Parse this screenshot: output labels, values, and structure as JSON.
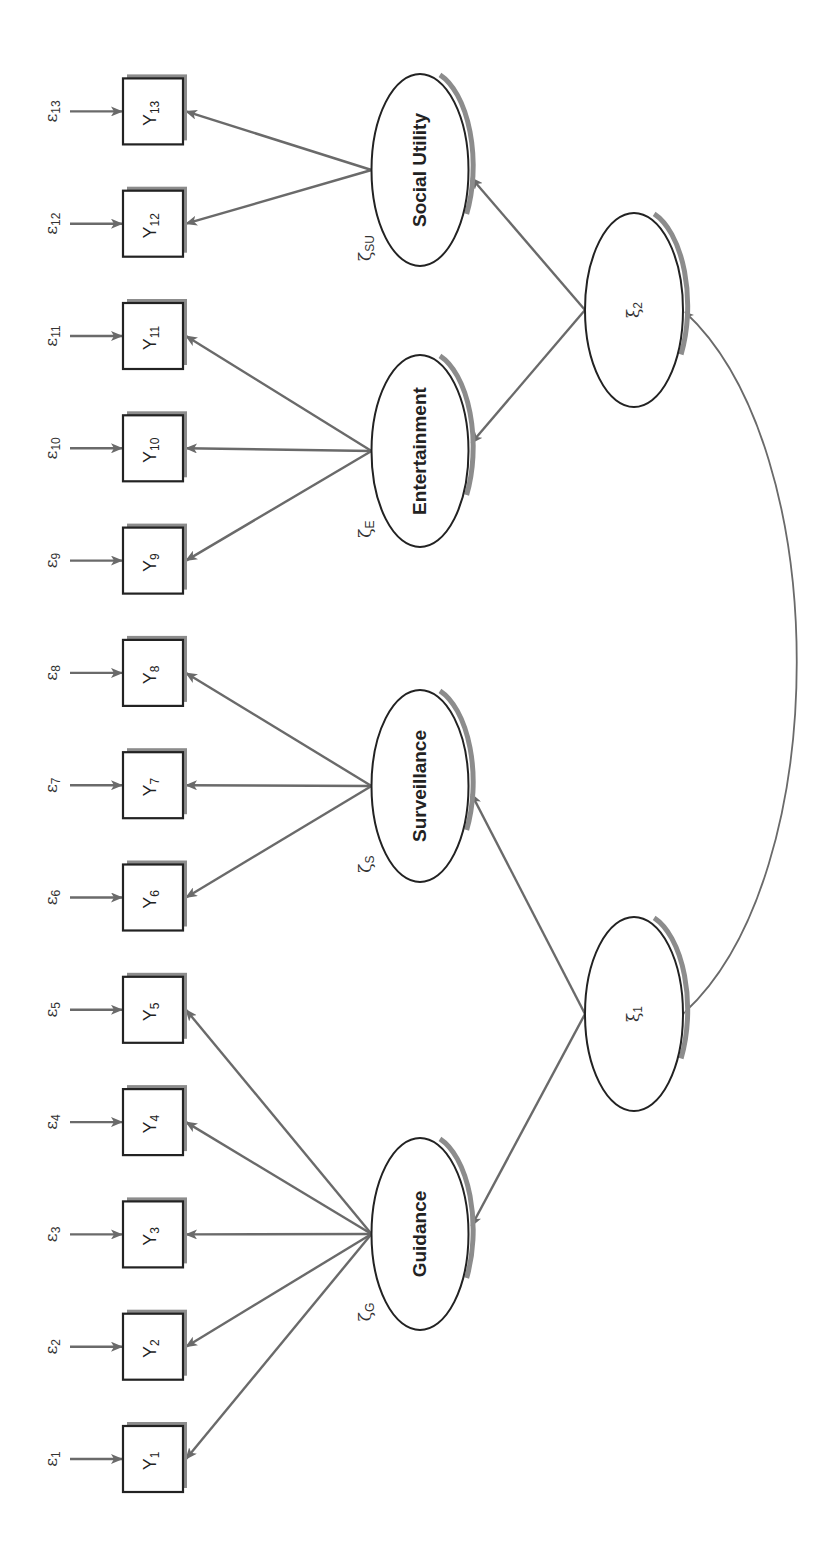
{
  "diagram": {
    "type": "structural-equation-model",
    "orientation": "rotated-90-ccw",
    "colors": {
      "path": "#6a6a6a",
      "shadow": "#8c8c8c",
      "outline": "#222222"
    },
    "observed": [
      {
        "id": "Y1",
        "base": "Y",
        "sub": "1",
        "error_base": "ε",
        "error_sub": "1",
        "factor": "guidance"
      },
      {
        "id": "Y2",
        "base": "Y",
        "sub": "2",
        "error_base": "ε",
        "error_sub": "2",
        "factor": "guidance"
      },
      {
        "id": "Y3",
        "base": "Y",
        "sub": "3",
        "error_base": "ε",
        "error_sub": "3",
        "factor": "guidance"
      },
      {
        "id": "Y4",
        "base": "Y",
        "sub": "4",
        "error_base": "ε",
        "error_sub": "4",
        "factor": "guidance"
      },
      {
        "id": "Y5",
        "base": "Y",
        "sub": "5",
        "error_base": "ε",
        "error_sub": "5",
        "factor": "guidance"
      },
      {
        "id": "Y6",
        "base": "Y",
        "sub": "6",
        "error_base": "ε",
        "error_sub": "6",
        "factor": "surveillance"
      },
      {
        "id": "Y7",
        "base": "Y",
        "sub": "7",
        "error_base": "ε",
        "error_sub": "7",
        "factor": "surveillance"
      },
      {
        "id": "Y8",
        "base": "Y",
        "sub": "8",
        "error_base": "ε",
        "error_sub": "8",
        "factor": "surveillance"
      },
      {
        "id": "Y9",
        "base": "Y",
        "sub": "9",
        "error_base": "ε",
        "error_sub": "9",
        "factor": "entertainment"
      },
      {
        "id": "Y10",
        "base": "Y",
        "sub": "10",
        "error_base": "ε",
        "error_sub": "10",
        "factor": "entertainment"
      },
      {
        "id": "Y11",
        "base": "Y",
        "sub": "11",
        "error_base": "ε",
        "error_sub": "11",
        "factor": "entertainment"
      },
      {
        "id": "Y12",
        "base": "Y",
        "sub": "12",
        "error_base": "ε",
        "error_sub": "12",
        "factor": "social_utility"
      },
      {
        "id": "Y13",
        "base": "Y",
        "sub": "13",
        "error_base": "ε",
        "error_sub": "13",
        "factor": "social_utility"
      }
    ],
    "factors": [
      {
        "id": "guidance",
        "label": "Guidance",
        "disturbance_base": "ζ",
        "disturbance_sub": "G",
        "parent": "xi1"
      },
      {
        "id": "surveillance",
        "label": "Surveillance",
        "disturbance_base": "ζ",
        "disturbance_sub": "S",
        "parent": "xi1"
      },
      {
        "id": "entertainment",
        "label": "Entertainment",
        "disturbance_base": "ζ",
        "disturbance_sub": "E",
        "parent": "xi2"
      },
      {
        "id": "social_utility",
        "label": "Social Utility",
        "disturbance_base": "ζ",
        "disturbance_sub": "SU",
        "parent": "xi2"
      }
    ],
    "exogenous": [
      {
        "id": "xi1",
        "base": "ξ",
        "sub": "1"
      },
      {
        "id": "xi2",
        "base": "ξ",
        "sub": "2"
      }
    ],
    "covariances": [
      {
        "from": "xi1",
        "to": "xi2"
      }
    ]
  }
}
